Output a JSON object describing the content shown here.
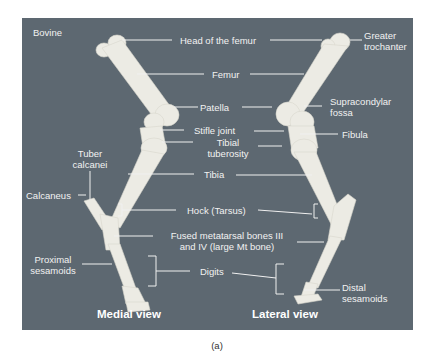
{
  "figure": {
    "species_label": "Bovine",
    "caption": "(a)",
    "views": {
      "medial": "Medial view",
      "lateral": "Lateral view"
    },
    "colors": {
      "background": "#5d6871",
      "bone": "#ecebe4",
      "label_text": "#f2f2f2",
      "leader_line": "#f0f0f0"
    },
    "labels": {
      "head_of_femur": "Head of the femur",
      "greater_trochanter_1": "Greater",
      "greater_trochanter_2": "trochanter",
      "femur": "Femur",
      "patella": "Patella",
      "supracondylar_fossa_1": "Supracondylar",
      "supracondylar_fossa_2": "fossa",
      "stifle_joint": "Stifle joint",
      "fibula": "Fibula",
      "tibial_tuberosity_1": "Tibial",
      "tibial_tuberosity_2": "tuberosity",
      "tuber_calcanei_1": "Tuber",
      "tuber_calcanei_2": "calcanei",
      "tibia": "Tibia",
      "calcaneus": "Calcaneus",
      "hock": "Hock (Tarsus)",
      "fused_metatarsal_1": "Fused metatarsal bones III",
      "fused_metatarsal_2": "and  IV (large Mt bone)",
      "proximal_sesamoids_1": "Proximal",
      "proximal_sesamoids_2": "sesamoids",
      "digits": "Digits",
      "distal_sesamoids_1": "Distal",
      "distal_sesamoids_2": "sesamoids"
    }
  }
}
